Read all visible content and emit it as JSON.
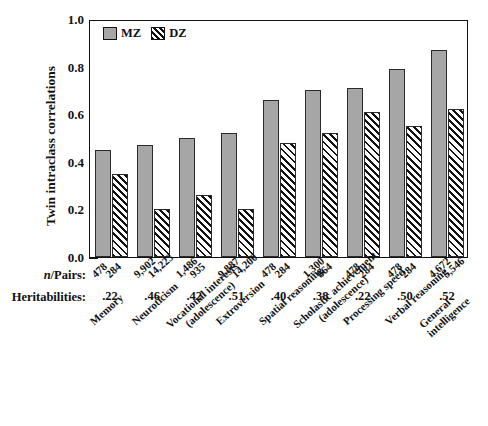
{
  "chart_data": {
    "type": "bar",
    "title": "",
    "xlabel": "",
    "ylabel": "Twin intraclass correlations",
    "ylim": [
      0.0,
      1.0
    ],
    "ytick_labels": [
      "0.0",
      "0.2",
      "0.4",
      "0.6",
      "0.8",
      "1.0"
    ],
    "ytick_values": [
      0.0,
      0.2,
      0.4,
      0.6,
      0.8,
      1.0
    ],
    "minor_tick_step": 0.05,
    "grid": false,
    "legend_position": "top-left",
    "categories": [
      "Memory",
      "Neuroticism",
      "Vocational interests (adolescence)",
      "Extroversion",
      "Spatial reasoning",
      "Scholastic achievement (adolescence)",
      "Processing speed",
      "Verbal reasoning",
      "General intelligence"
    ],
    "series": [
      {
        "name": "MZ",
        "color": "#a6a6a6",
        "values": [
          0.45,
          0.47,
          0.5,
          0.52,
          0.66,
          0.7,
          0.71,
          0.79,
          0.87
        ]
      },
      {
        "name": "DZ",
        "color": "#111111",
        "values": [
          0.35,
          0.2,
          0.26,
          0.2,
          0.48,
          0.52,
          0.61,
          0.55,
          0.62
        ]
      }
    ],
    "n_pairs": [
      {
        "mz": "478",
        "dz": "284"
      },
      {
        "mz": "9,902",
        "dz": "14,223"
      },
      {
        "mz": "1,486",
        "dz": "935"
      },
      {
        "mz": "9,887",
        "dz": "14,200"
      },
      {
        "mz": "478",
        "dz": "284"
      },
      {
        "mz": "1,300",
        "dz": "864"
      },
      {
        "mz": "478",
        "dz": "284"
      },
      {
        "mz": "478",
        "dz": "284"
      },
      {
        "mz": "4,672",
        "dz": "5,546"
      }
    ],
    "heritabilities": [
      ".22",
      ".46",
      ".42",
      ".51",
      ".40",
      ".38",
      ".22",
      ".50",
      ".52"
    ]
  },
  "legend": {
    "mz_label": "MZ",
    "dz_label": "DZ"
  },
  "row_labels": {
    "npairs_prefix": "n",
    "npairs_suffix": "/Pairs:",
    "heritabilities": "Heritabilities:"
  },
  "category_lines": [
    {
      "l1": "Memory",
      "l2": ""
    },
    {
      "l1": "Neuroticism",
      "l2": ""
    },
    {
      "l1": "Vocational interests",
      "l2": "(adolescence)"
    },
    {
      "l1": "Extroversion",
      "l2": ""
    },
    {
      "l1": "Spatial reasoning",
      "l2": ""
    },
    {
      "l1": "Scholastic achievement",
      "l2": "(adolescence)"
    },
    {
      "l1": "Processing speed",
      "l2": ""
    },
    {
      "l1": "Verbal reasoning",
      "l2": ""
    },
    {
      "l1": "General",
      "l2": "intelligence"
    }
  ]
}
